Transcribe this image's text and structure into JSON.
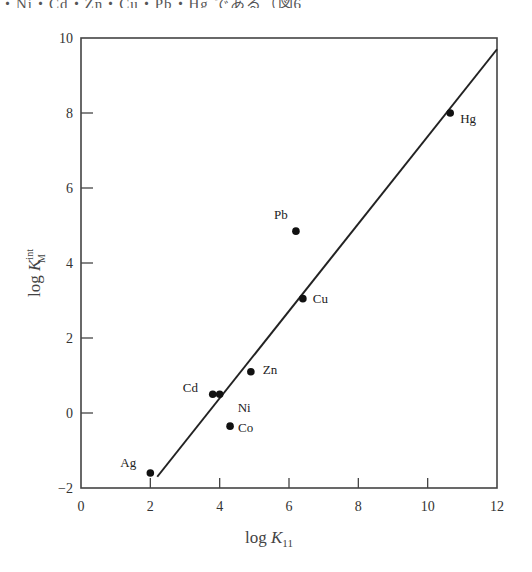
{
  "top_text": "・Ni・Cd・Zn・Cu・Pb・Hg である（図6",
  "chart_data": {
    "type": "scatter",
    "title": "",
    "xlabel": "log K11",
    "ylabel": "log K_M^int",
    "xlabel_main": "log K",
    "xlabel_sub": "11",
    "ylabel_main": "log K",
    "ylabel_sup": "int",
    "ylabel_sub": "M",
    "xlim": [
      0,
      12
    ],
    "ylim": [
      -2,
      10
    ],
    "xticks": [
      0,
      2,
      4,
      6,
      8,
      10,
      12
    ],
    "yticks": [
      -2,
      0,
      2,
      4,
      6,
      8,
      10
    ],
    "grid": false,
    "legend": null,
    "points": [
      {
        "label": "Ag",
        "x": 2.0,
        "y": -1.6
      },
      {
        "label": "Cd",
        "x": 3.8,
        "y": 0.5
      },
      {
        "label": "Ni",
        "x": 4.0,
        "y": 0.5
      },
      {
        "label": "Co",
        "x": 4.3,
        "y": -0.35
      },
      {
        "label": "Zn",
        "x": 4.9,
        "y": 1.1
      },
      {
        "label": "Pb",
        "x": 6.2,
        "y": 4.85
      },
      {
        "label": "Cu",
        "x": 6.4,
        "y": 3.05
      },
      {
        "label": "Hg",
        "x": 10.65,
        "y": 8.0
      }
    ],
    "fit_line": {
      "x": [
        2.2,
        12.0
      ],
      "y": [
        -1.7,
        9.7
      ]
    }
  }
}
